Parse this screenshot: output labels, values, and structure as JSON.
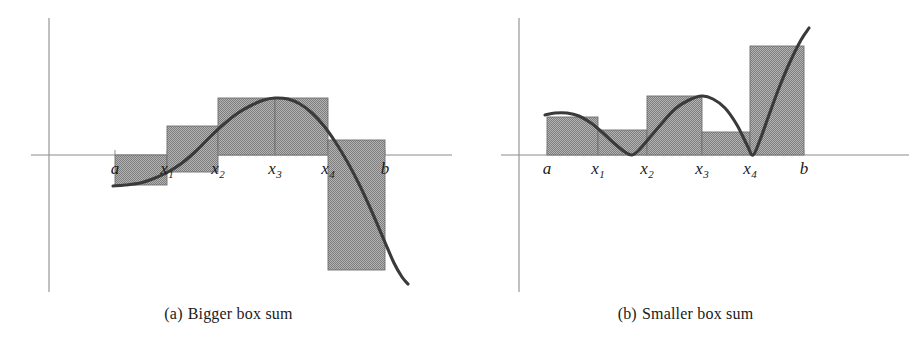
{
  "figure": {
    "background": "#ffffff",
    "fill_color": "#9a9a9a",
    "curve_color": "#3a3a3a",
    "axis_color": "#8c8c8c"
  },
  "panels": [
    {
      "id": "a",
      "caption_label": "(a)",
      "caption_text": "Bigger box sum",
      "tick_labels": [
        "a",
        "x",
        "x",
        "x",
        "x",
        "b"
      ],
      "tick_display": [
        "a",
        "x1",
        "x2",
        "x3",
        "x4",
        "b"
      ],
      "tick_main": [
        "a",
        "x",
        "x",
        "x",
        "x",
        "b"
      ],
      "tick_subscripts": [
        "",
        "1",
        "2",
        "3",
        "4",
        ""
      ],
      "axis_x_y": 155,
      "axis_y_x": 49,
      "partition_x": [
        115,
        167,
        218,
        275,
        328,
        385
      ],
      "bars": [
        {
          "name": "bar-a-x1",
          "x0": 115,
          "x1": 167,
          "top": 185,
          "bottom": 155
        },
        {
          "name": "bar-x1-x2",
          "x0": 167,
          "x1": 218,
          "top": 126,
          "bottom": 172
        },
        {
          "name": "bar-x2-x3",
          "x0": 218,
          "x1": 275,
          "top": 98,
          "bottom": 155
        },
        {
          "name": "bar-x3-x4",
          "x0": 275,
          "x1": 328,
          "top": 98,
          "bottom": 155
        },
        {
          "name": "bar-x4-b",
          "x0": 328,
          "x1": 385,
          "top": 140,
          "bottom": 270
        }
      ],
      "curve_points": [
        [
          113,
          186
        ],
        [
          125,
          185
        ],
        [
          140,
          183
        ],
        [
          155,
          178
        ],
        [
          168,
          172
        ],
        [
          182,
          163
        ],
        [
          196,
          151
        ],
        [
          210,
          137
        ],
        [
          224,
          124
        ],
        [
          238,
          113
        ],
        [
          252,
          105
        ],
        [
          264,
          100
        ],
        [
          275,
          98
        ],
        [
          288,
          99
        ],
        [
          300,
          104
        ],
        [
          312,
          113
        ],
        [
          324,
          126
        ],
        [
          336,
          143
        ],
        [
          348,
          163
        ],
        [
          360,
          186
        ],
        [
          372,
          212
        ],
        [
          384,
          240
        ],
        [
          394,
          263
        ],
        [
          402,
          277
        ],
        [
          408,
          284
        ]
      ]
    },
    {
      "id": "b",
      "caption_label": "(b)",
      "caption_text": "Smaller box sum",
      "tick_labels": [
        "a",
        "x",
        "x",
        "x",
        "x",
        "b"
      ],
      "tick_display": [
        "a",
        "x1",
        "x2",
        "x3",
        "x4",
        "b"
      ],
      "tick_main": [
        "a",
        "x",
        "x",
        "x",
        "x",
        "b"
      ],
      "tick_subscripts": [
        "",
        "1",
        "2",
        "3",
        "4",
        ""
      ],
      "axis_x_y": 155,
      "axis_y_x": 62,
      "partition_x": [
        90,
        141,
        190,
        245,
        293,
        347
      ],
      "bars": [
        {
          "name": "bar-a-x1",
          "x0": 90,
          "x1": 141,
          "top": 117,
          "bottom": 155
        },
        {
          "name": "bar-x1-x2",
          "x0": 141,
          "x1": 190,
          "top": 130,
          "bottom": 155
        },
        {
          "name": "bar-x2-x3",
          "x0": 190,
          "x1": 245,
          "top": 96,
          "bottom": 155
        },
        {
          "name": "bar-x3-x4",
          "x0": 245,
          "x1": 293,
          "top": 132,
          "bottom": 155
        },
        {
          "name": "bar-x4-b",
          "x0": 293,
          "x1": 347,
          "top": 46,
          "bottom": 155
        }
      ],
      "curve_points": [
        [
          88,
          115
        ],
        [
          98,
          113
        ],
        [
          110,
          113
        ],
        [
          122,
          116
        ],
        [
          134,
          123
        ],
        [
          146,
          133
        ],
        [
          158,
          144
        ],
        [
          168,
          152
        ],
        [
          175,
          155
        ],
        [
          182,
          150
        ],
        [
          194,
          136
        ],
        [
          206,
          122
        ],
        [
          218,
          109
        ],
        [
          232,
          100
        ],
        [
          245,
          96
        ],
        [
          256,
          99
        ],
        [
          268,
          108
        ],
        [
          280,
          125
        ],
        [
          290,
          145
        ],
        [
          296,
          155
        ],
        [
          303,
          140
        ],
        [
          312,
          115
        ],
        [
          322,
          88
        ],
        [
          333,
          62
        ],
        [
          344,
          40
        ],
        [
          352,
          28
        ]
      ]
    }
  ]
}
